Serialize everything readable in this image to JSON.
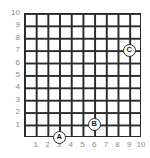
{
  "chart_data": {
    "type": "scatter",
    "title": "",
    "xlabel": "",
    "ylabel": "",
    "xlim": [
      0,
      10
    ],
    "ylim": [
      0,
      10
    ],
    "grid": true,
    "grid_step": 1,
    "legend": "none",
    "xticks": [
      "1",
      "2",
      "3",
      "4",
      "5",
      "6",
      "7",
      "8",
      "9",
      "10"
    ],
    "yticks": [
      "1",
      "2",
      "3",
      "4",
      "5",
      "6",
      "7",
      "8",
      "9",
      "10"
    ],
    "points": [
      {
        "label": "A",
        "x": 3,
        "y": 0
      },
      {
        "label": "B",
        "x": 6,
        "y": 1
      },
      {
        "label": "C",
        "x": 9,
        "y": 7
      }
    ]
  },
  "colors": {
    "grid_line": "#2b2b2b",
    "tick_label": "#8a8a8a",
    "marker_fill": "#ffffff",
    "marker_stroke": "#2b2b2b",
    "background": "#ffffff"
  }
}
